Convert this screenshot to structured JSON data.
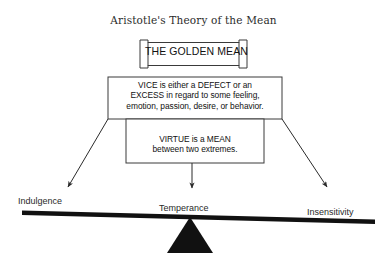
{
  "title": "Aristotle's Theory of the Mean",
  "boxes": {
    "golden_mean": {
      "label": "THE GOLDEN MEAN",
      "style": "banner-plaque"
    },
    "vice": {
      "line1": "VICE is either a DEFECT or an",
      "line2": "EXCESS in regard to some feeling,",
      "line3": "emotion, passion, desire, or behavior."
    },
    "virtue": {
      "line1": "VIRTUE is a MEAN",
      "line2": "between two extremes."
    }
  },
  "scale": {
    "left_label": "Indulgence",
    "center_label": "Temperance",
    "right_label": "Insensitivity"
  },
  "arrows": {
    "left": "arrow-down-left",
    "center": "arrow-down",
    "right": "arrow-down-right"
  },
  "colors": {
    "ink": "#111111",
    "title_ink": "#2b2b2b",
    "stroke": "#3a3a3a",
    "beam": "#111111",
    "fulcrum": "#111111",
    "background": "#ffffff"
  }
}
